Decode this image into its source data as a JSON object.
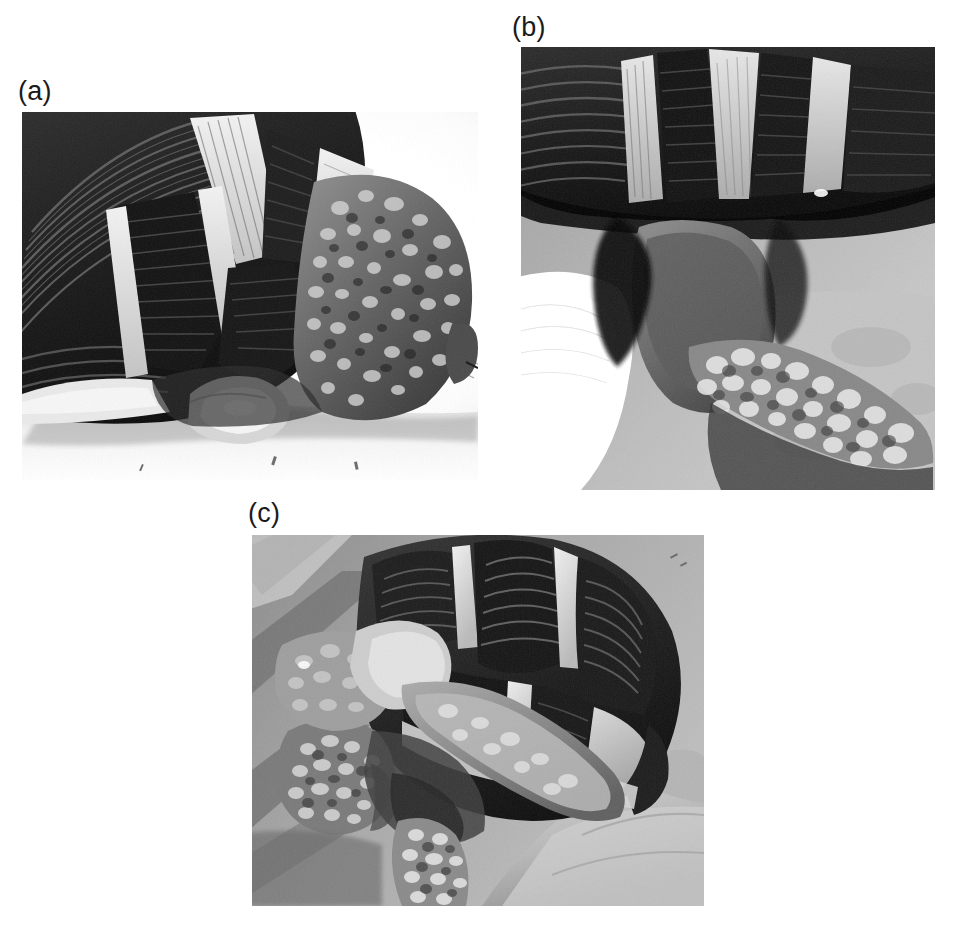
{
  "figure": {
    "background_color": "#ffffff",
    "width": 956,
    "height": 930,
    "media": "grayscale-photograph-plate",
    "panel_count": 3
  },
  "panels": [
    {
      "id": "a",
      "label": "(a)",
      "label_x": 18,
      "label_y": 78,
      "x": 22,
      "y": 112,
      "w": 456,
      "h": 368,
      "view": "lateral view of tortoise hindquarters showing carapace margin, plastron and hind limb",
      "features": [
        "marginal scutes with concentric growth annuli",
        "pale cream seams between dark scutes",
        "granular tuberculate scales on hind limb",
        "pale swollen cloacal region",
        "smooth light substrate background"
      ],
      "tone": {
        "shell_dark": "#2b2b2b",
        "seam_light": "#d9d4c6",
        "limb_mid": "#6d6a63",
        "background_light": "#eceae6"
      }
    },
    {
      "id": "b",
      "label": "(b)",
      "label_x": 512,
      "label_y": 14,
      "x": 521,
      "y": 47,
      "w": 414,
      "h": 443,
      "view": "close-up of caudal carapace margin, tail and hind limb",
      "features": [
        "supracaudal and marginal scutes with growth rings",
        "bright pale seams radiating between scutes",
        "heavily tuberculate granular hind limb scales",
        "white cloth or glove at left margin",
        "pale sandy substrate at right"
      ],
      "tone": {
        "shell_dark": "#2e2e2e",
        "seam_light": "#cfcabd",
        "limb_mid": "#7b7greater",
        "background_light": "#b9b5ad"
      }
    },
    {
      "id": "c",
      "label": "(c)",
      "label_x": 248,
      "label_y": 500,
      "x": 252,
      "y": 535,
      "w": 452,
      "h": 371,
      "view": "tortoise held in hand, ventro-lateral view of head, forelimb and carapace",
      "features": [
        "costal and marginal scutes with strong concentric annuli",
        "pale seams forming light grid over dark scutes",
        "head and forelimb with coarse tubercles",
        "human fingers supporting animal at right",
        "dark striped background surface at left"
      ],
      "tone": {
        "shell_dark": "#343434",
        "seam_light": "#dedacd",
        "limb_mid": "#8d8a82",
        "background_light": "#a9a59d"
      }
    }
  ],
  "labels": {
    "a": "(a)",
    "b": "(b)",
    "c": "(c)"
  }
}
